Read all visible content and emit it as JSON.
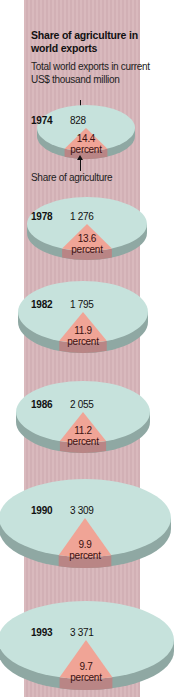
{
  "title": "Share of agriculture in world exports",
  "subtitle": "Total world exports in current US$ thousand million",
  "share_label": "Share of agriculture",
  "percent_word": "percent",
  "colors": {
    "strip": "#d9b9bd",
    "pie_top": "#c6e2dc",
    "pie_side": "#8fa8a3",
    "slice_top": "#f0a496",
    "slice_side": "#b98585"
  },
  "chart_data": {
    "type": "pie",
    "title": "Share of agriculture in world exports",
    "subtitle": "Total world exports in current US$ thousand million",
    "annotation": "Share of agriculture",
    "years": [
      "1974",
      "1978",
      "1982",
      "1986",
      "1990",
      "1993"
    ],
    "series": [
      {
        "name": "Total world exports (US$ thousand million)",
        "values": [
          828,
          1276,
          1795,
          2055,
          3309,
          3371
        ]
      },
      {
        "name": "Share of agriculture (percent)",
        "values": [
          14.4,
          13.6,
          11.9,
          11.2,
          9.9,
          9.7
        ]
      }
    ],
    "total_labels": [
      "828",
      "1 276",
      "1 795",
      "2 055",
      "3 309",
      "3 371"
    ],
    "share_labels": [
      "14.4",
      "13.6",
      "11.9",
      "11.2",
      "9.9",
      "9.7"
    ]
  },
  "pies": [
    {
      "year": "1974",
      "total": "828",
      "share": "14.4"
    },
    {
      "year": "1978",
      "total": "1 276",
      "share": "13.6"
    },
    {
      "year": "1982",
      "total": "1 795",
      "share": "11.9"
    },
    {
      "year": "1986",
      "total": "2 055",
      "share": "11.2"
    },
    {
      "year": "1990",
      "total": "3 309",
      "share": "9.9"
    },
    {
      "year": "1993",
      "total": "3 371",
      "share": "9.7"
    }
  ]
}
